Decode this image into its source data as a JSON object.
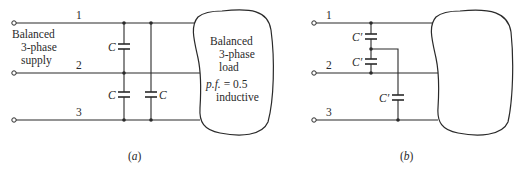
{
  "figure": {
    "panel_a": {
      "caption": "(a)",
      "caption_letter": "a",
      "lines": [
        {
          "label": "1"
        },
        {
          "label": "2"
        },
        {
          "label": "3"
        }
      ],
      "supply_label": [
        "Balanced",
        "3-phase",
        "supply"
      ],
      "capacitors": [
        {
          "label": "C",
          "between": "1-2"
        },
        {
          "label": "C",
          "between": "2-3"
        },
        {
          "label": "C",
          "between": "1-3"
        }
      ],
      "load_label": [
        "Balanced",
        "3-phase",
        "load",
        "p.f. = 0.5",
        "inductive"
      ],
      "load_pf_prefix": "p.f.",
      "load_pf_value": "= 0.5"
    },
    "panel_b": {
      "caption": "(b)",
      "caption_letter": "b",
      "lines": [
        {
          "label": "1"
        },
        {
          "label": "2"
        },
        {
          "label": "3"
        }
      ],
      "capacitors": [
        {
          "label": "C′"
        },
        {
          "label": "C′"
        },
        {
          "label": "C′"
        }
      ]
    }
  }
}
